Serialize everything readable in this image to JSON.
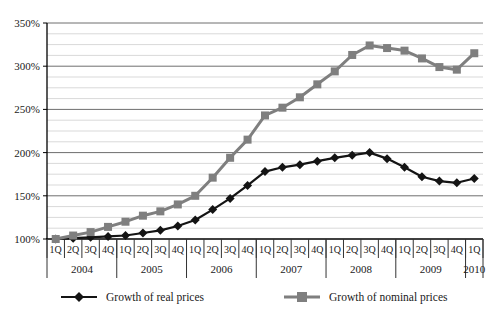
{
  "chart_data": {
    "type": "line",
    "title": "",
    "xlabel": "",
    "ylabel": "",
    "grid": true,
    "legend_position": "bottom",
    "y_axis": {
      "min": 100,
      "max": 350,
      "major_step": 50,
      "minor_step": 12.5,
      "tick_labels": [
        "100%",
        "150%",
        "200%",
        "250%",
        "300%",
        "350%"
      ],
      "tick_values": [
        100,
        150,
        200,
        250,
        300,
        350
      ]
    },
    "x_axis": {
      "quarter_labels": [
        "1Q",
        "2Q",
        "3Q",
        "4Q",
        "1Q",
        "2Q",
        "3Q",
        "4Q",
        "1Q",
        "2Q",
        "3Q",
        "4Q",
        "1Q",
        "2Q",
        "3Q",
        "4Q",
        "1Q",
        "2Q",
        "3Q",
        "4Q",
        "1Q",
        "2Q",
        "3Q",
        "4Q",
        "1Q"
      ],
      "year_groups": [
        {
          "label": "2004",
          "quarters": 4
        },
        {
          "label": "2005",
          "quarters": 4
        },
        {
          "label": "2006",
          "quarters": 4
        },
        {
          "label": "2007",
          "quarters": 4
        },
        {
          "label": "2008",
          "quarters": 4
        },
        {
          "label": "2009",
          "quarters": 4
        },
        {
          "label": "2010",
          "quarters": 1
        }
      ]
    },
    "series": [
      {
        "name": "Growth of real prices",
        "marker": "diamond",
        "color": "#141414",
        "values": [
          100,
          101,
          102,
          103,
          104,
          107,
          110,
          115,
          122,
          134,
          147,
          162,
          178,
          183,
          186,
          190,
          194,
          197,
          200,
          193,
          183,
          172,
          167,
          165,
          170
        ]
      },
      {
        "name": "Growth of nominal prices",
        "marker": "square",
        "color": "#7f7f7f",
        "values": [
          100,
          104,
          108,
          114,
          120,
          127,
          132,
          140,
          150,
          171,
          194,
          215,
          243,
          252,
          264,
          279,
          294,
          313,
          324,
          321,
          318,
          309,
          299,
          296,
          315
        ]
      }
    ],
    "colors": {
      "axis": "#000000",
      "major_grid": "#6e6e6e",
      "minor_grid": "#d9d9d9",
      "text": "#1a1a1a"
    }
  }
}
